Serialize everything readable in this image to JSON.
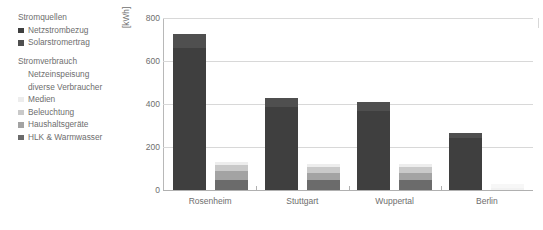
{
  "legend": {
    "groups": [
      {
        "title": "Stromquellen",
        "items": [
          {
            "label": "Netzstrombezug",
            "color": "#3f3f3f",
            "swatch": true
          },
          {
            "label": "Solarstromertrag",
            "color": "#4f4f4f",
            "swatch": true
          }
        ]
      },
      {
        "title": "Stromverbrauch",
        "items": [
          {
            "label": "Netzeinspeisung",
            "color": "#ffffff",
            "swatch": false
          },
          {
            "label": "diverse Verbraucher",
            "color": "#ffffff",
            "swatch": false
          },
          {
            "label": "Medien",
            "color": "#ededed",
            "swatch": true
          },
          {
            "label": "Beleuchtung",
            "color": "#c9c9c9",
            "swatch": true
          },
          {
            "label": "Haushaltsgeräte",
            "color": "#a3a3a3",
            "swatch": true
          },
          {
            "label": "HLK & Warmwasser",
            "color": "#6b6b6b",
            "swatch": true
          }
        ]
      }
    ]
  },
  "chart_data": {
    "type": "bar",
    "title": "",
    "xlabel": "",
    "ylabel": "[kWh]",
    "ylim": [
      0,
      800
    ],
    "yticks": [
      0,
      200,
      400,
      600,
      800
    ],
    "grid": true,
    "legend_position": "left",
    "categories": [
      "Rosenheim",
      "Stuttgart",
      "Wuppertal",
      "Berlin"
    ],
    "bar_groups": [
      {
        "category": "Rosenheim",
        "bars": [
          {
            "name": "Stromquellen",
            "segments": [
              {
                "name": "Netzstrombezug",
                "value": 660,
                "color": "#3f3f3f"
              },
              {
                "name": "Solarstromertrag",
                "value": 65,
                "color": "#4f4f4f"
              }
            ],
            "total": 725
          },
          {
            "name": "Stromverbrauch",
            "segments": [
              {
                "name": "HLK & Warmwasser",
                "value": 48,
                "color": "#6b6b6b"
              },
              {
                "name": "Haushaltsgeräte",
                "value": 40,
                "color": "#a3a3a3"
              },
              {
                "name": "Beleuchtung",
                "value": 30,
                "color": "#c9c9c9"
              },
              {
                "name": "Medien",
                "value": 12,
                "color": "#ededed"
              },
              {
                "name": "diverse Verbraucher",
                "value": 0,
                "color": "#ffffff"
              },
              {
                "name": "Netzeinspeisung",
                "value": 0,
                "color": "#ffffff"
              }
            ],
            "total": 130
          }
        ]
      },
      {
        "category": "Stuttgart",
        "bars": [
          {
            "name": "Stromquellen",
            "segments": [
              {
                "name": "Netzstrombezug",
                "value": 385,
                "color": "#3f3f3f"
              },
              {
                "name": "Solarstromertrag",
                "value": 45,
                "color": "#4f4f4f"
              }
            ],
            "total": 430
          },
          {
            "name": "Stromverbrauch",
            "segments": [
              {
                "name": "HLK & Warmwasser",
                "value": 45,
                "color": "#6b6b6b"
              },
              {
                "name": "Haushaltsgeräte",
                "value": 35,
                "color": "#a3a3a3"
              },
              {
                "name": "Beleuchtung",
                "value": 28,
                "color": "#c9c9c9"
              },
              {
                "name": "Medien",
                "value": 12,
                "color": "#ededed"
              },
              {
                "name": "diverse Verbraucher",
                "value": 0,
                "color": "#ffffff"
              },
              {
                "name": "Netzeinspeisung",
                "value": 0,
                "color": "#ffffff"
              }
            ],
            "total": 120
          }
        ]
      },
      {
        "category": "Wuppertal",
        "bars": [
          {
            "name": "Stromquellen",
            "segments": [
              {
                "name": "Netzstrombezug",
                "value": 368,
                "color": "#3f3f3f"
              },
              {
                "name": "Solarstromertrag",
                "value": 42,
                "color": "#4f4f4f"
              }
            ],
            "total": 410
          },
          {
            "name": "Stromverbrauch",
            "segments": [
              {
                "name": "HLK & Warmwasser",
                "value": 45,
                "color": "#6b6b6b"
              },
              {
                "name": "Haushaltsgeräte",
                "value": 35,
                "color": "#a3a3a3"
              },
              {
                "name": "Beleuchtung",
                "value": 28,
                "color": "#c9c9c9"
              },
              {
                "name": "Medien",
                "value": 12,
                "color": "#ededed"
              },
              {
                "name": "diverse Verbraucher",
                "value": 0,
                "color": "#ffffff"
              },
              {
                "name": "Netzeinspeisung",
                "value": 0,
                "color": "#ffffff"
              }
            ],
            "total": 120
          }
        ]
      },
      {
        "category": "Berlin",
        "bars": [
          {
            "name": "Stromquellen",
            "segments": [
              {
                "name": "Netzstrombezug",
                "value": 240,
                "color": "#3f3f3f"
              },
              {
                "name": "Solarstromertrag",
                "value": 25,
                "color": "#4f4f4f"
              }
            ],
            "total": 265
          },
          {
            "name": "Stromverbrauch",
            "segments": [
              {
                "name": "HLK & Warmwasser",
                "value": 0,
                "color": "#ffffff"
              },
              {
                "name": "Haushaltsgeräte",
                "value": 0,
                "color": "#ffffff"
              },
              {
                "name": "Beleuchtung",
                "value": 8,
                "color": "#f2f2f2"
              },
              {
                "name": "Medien",
                "value": 18,
                "color": "#f7f7f7"
              },
              {
                "name": "diverse Verbraucher",
                "value": 0,
                "color": "#ffffff"
              },
              {
                "name": "Netzeinspeisung",
                "value": 0,
                "color": "#ffffff"
              }
            ],
            "total": 26
          }
        ]
      }
    ]
  }
}
